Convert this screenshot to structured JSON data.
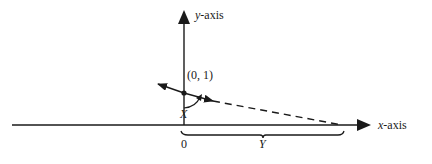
{
  "diagram": {
    "y_axis_label_var": "y",
    "y_axis_label_rest": "-axis",
    "x_axis_label_var": "x",
    "x_axis_label_rest": "-axis",
    "point_label": "(0, 1)",
    "angle_label": "X",
    "origin_label": "0",
    "distance_label": "Y",
    "colors": {
      "ink": "#1a1a1a",
      "background": "#ffffff"
    }
  }
}
